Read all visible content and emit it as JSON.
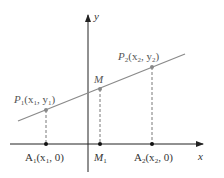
{
  "diagram": {
    "axes": {
      "x_label": "x",
      "y_label": "y"
    },
    "points": {
      "P1": {
        "name": "P",
        "sub": "1",
        "coords": "(x",
        "coords_sub": "1",
        "coords_mid": ", y",
        "coords_sub2": "1",
        "coords_end": ")"
      },
      "P2": {
        "name": "P",
        "sub": "2",
        "coords": "(x",
        "coords_sub": "2",
        "coords_mid": ", y",
        "coords_sub2": "2",
        "coords_end": ")"
      },
      "M": {
        "name": "M"
      },
      "A1": {
        "name": "A",
        "sub": "1",
        "coords": "(x",
        "coords_sub": "1",
        "coords_end": ", 0)"
      },
      "M1": {
        "name": "M",
        "sub": "1"
      },
      "A2": {
        "name": "A",
        "sub": "2",
        "coords": "(x",
        "coords_sub": "2",
        "coords_end": ", 0)"
      }
    },
    "colors": {
      "line": "#8a8a8a",
      "axis": "#222222",
      "point": "#777777",
      "axis_point": "#111111"
    }
  }
}
